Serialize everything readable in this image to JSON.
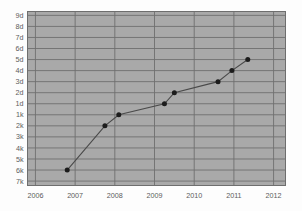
{
  "chart_data": {
    "type": "line",
    "title": "",
    "subtitle": "",
    "xlabel": "",
    "ylabel": "",
    "grid": true,
    "legend": false,
    "legend_position": "none",
    "background_color": "#a9a9a9",
    "grid_color": "#6f6f6f",
    "line_color": "#4a4a4a",
    "marker_color": "#1c1c1c",
    "axis_text_color": "#5c5c5c",
    "x_tick_labels": [
      "2006",
      "2007",
      "2008",
      "2009",
      "2010",
      "2011",
      "2012"
    ],
    "x_tick_values": [
      2006,
      2007,
      2008,
      2009,
      2010,
      2011,
      2012
    ],
    "xlim": [
      2005.8,
      2012.3
    ],
    "y_tick_labels": [
      "9d",
      "8d",
      "7d",
      "6d",
      "5d",
      "4d",
      "3d",
      "2d",
      "1d",
      "1k",
      "2k",
      "3k",
      "4k",
      "5k",
      "6k",
      "7k"
    ],
    "y_tick_index": [
      0,
      1,
      2,
      3,
      4,
      5,
      6,
      7,
      8,
      9,
      10,
      11,
      12,
      13,
      14,
      15
    ],
    "ylim_index": [
      -0.35,
      15.4
    ],
    "series": [
      {
        "name": "series-1",
        "x": [
          2006.8,
          2007.75,
          2008.1,
          2009.25,
          2009.5,
          2010.6,
          2010.95,
          2011.35
        ],
        "y_labels": [
          "6k",
          "2k",
          "1k",
          "1d",
          "2d",
          "3d",
          "4d",
          "5d"
        ],
        "y_index": [
          14,
          10,
          9,
          8,
          7,
          6,
          5,
          4
        ]
      }
    ]
  }
}
